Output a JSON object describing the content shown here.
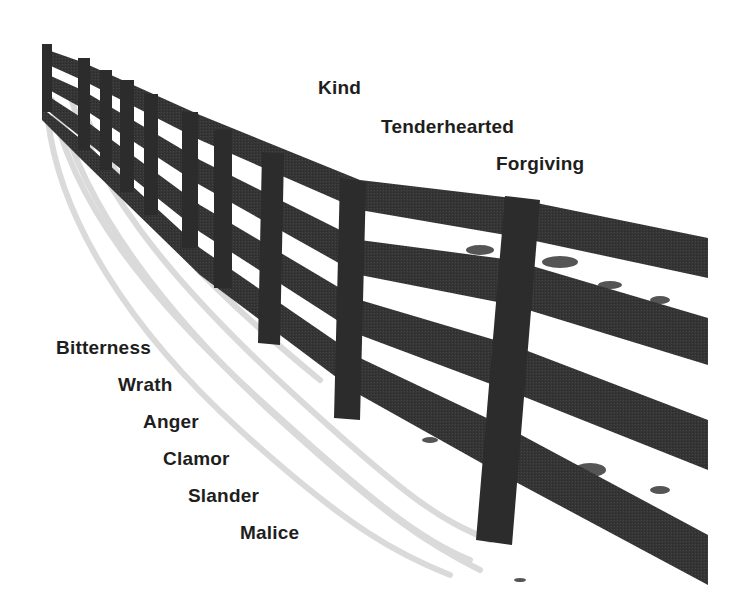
{
  "image": {
    "description": "Grayscale photograph of a wooden rail fence receding into the distance across snow, with words overlaid",
    "colors": {
      "background": "#ffffff",
      "fence": "#333333",
      "shadow": "#c8c8c8",
      "text": "#1e1e1e"
    }
  },
  "virtues": {
    "items": [
      {
        "label": "Kind"
      },
      {
        "label": "Tenderhearted"
      },
      {
        "label": "Forgiving"
      }
    ]
  },
  "vices": {
    "items": [
      {
        "label": "Bitterness"
      },
      {
        "label": "Wrath"
      },
      {
        "label": "Anger"
      },
      {
        "label": "Clamor"
      },
      {
        "label": "Slander"
      },
      {
        "label": "Malice"
      }
    ]
  }
}
